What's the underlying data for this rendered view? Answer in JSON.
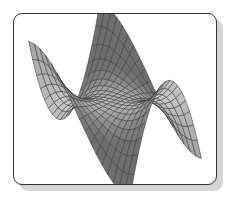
{
  "figure": {
    "kind": "3d-surface-mesh-illustration",
    "caption": "",
    "frame": {
      "border_color": "#30313a",
      "fill_color": "#ffffff",
      "shadow_color": "#d5d5d5",
      "corner_radius_px": 9
    }
  },
  "chart_data": {
    "type": "surface",
    "title": "",
    "subtitle": "",
    "xlabel": "",
    "ylabel": "",
    "zlabel": "",
    "grid": true,
    "legend": null,
    "annotations": [],
    "surface_name": "saddle-surface",
    "function": "z = x^3 - 3*x*y^2 (monkey saddle, wireframe shaded)",
    "grid_divisions": {
      "u": 18,
      "v": 18
    },
    "xlim": [
      -1,
      1
    ],
    "ylim": [
      -1,
      1
    ],
    "zlim": [
      -1,
      1
    ],
    "colors": {
      "mesh_line": "#3c3c3c",
      "facet_light": "#c9c9c9",
      "facet_mid": "#a9a9a9",
      "facet_dark": "#8a8a8a",
      "facet_darkest": "#6e6e6e",
      "curtain_light": "#dedede",
      "background": "#ffffff"
    },
    "view": {
      "azimuth_deg": 35,
      "elevation_deg": 22,
      "projection": "orthographic"
    },
    "silhouette_points_px": [
      [
        25,
        108
      ],
      [
        96,
        47
      ],
      [
        133,
        28
      ],
      [
        160,
        33
      ],
      [
        163,
        92
      ],
      [
        205,
        70
      ],
      [
        186,
        118
      ],
      [
        136,
        157
      ],
      [
        93,
        152
      ],
      [
        92,
        110
      ],
      [
        62,
        118
      ]
    ]
  }
}
